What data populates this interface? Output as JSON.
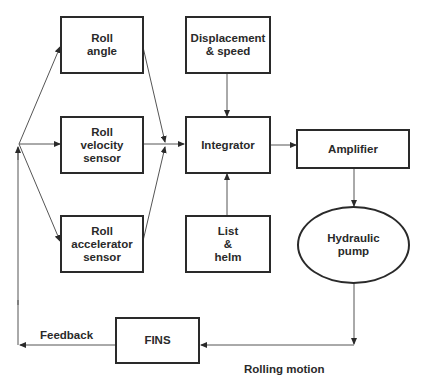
{
  "diagram": {
    "nodes": {
      "roll_angle": "Roll\nangle",
      "roll_velocity": "Roll\nvelocity\nsensor",
      "roll_accel": "Roll\naccelerator\nsensor",
      "displacement": "Displacement\n& speed",
      "integrator": "Integrator",
      "list_helm": "List\n&\nhelm",
      "amplifier": "Amplifier",
      "pump": "Hydraulic\npump",
      "fins": "FINS"
    },
    "labels": {
      "feedback": "Feedback",
      "rolling_motion": "Rolling motion"
    },
    "edges": [
      {
        "from": "feedback-junction",
        "to": "roll_angle"
      },
      {
        "from": "feedback-junction",
        "to": "roll_velocity"
      },
      {
        "from": "feedback-junction",
        "to": "roll_accel"
      },
      {
        "from": "roll_angle",
        "to": "integrator"
      },
      {
        "from": "roll_velocity",
        "to": "integrator"
      },
      {
        "from": "roll_accel",
        "to": "integrator"
      },
      {
        "from": "displacement",
        "to": "integrator"
      },
      {
        "from": "list_helm",
        "to": "integrator"
      },
      {
        "from": "integrator",
        "to": "amplifier"
      },
      {
        "from": "amplifier",
        "to": "pump"
      },
      {
        "from": "pump",
        "to": "fins"
      },
      {
        "from": "fins",
        "to": "feedback-junction"
      }
    ]
  }
}
